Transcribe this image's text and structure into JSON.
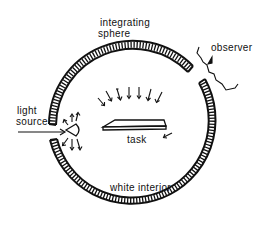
{
  "diagram": {
    "title": "integrating sphere",
    "labels": {
      "sphere_line1": "integrating",
      "sphere_line2": "sphere",
      "observer": "observer",
      "light_line1": "light",
      "light_line2": "source",
      "task": "task",
      "interior": "white interior"
    },
    "colors": {
      "ink": "#111111",
      "background": "#ffffff"
    }
  }
}
